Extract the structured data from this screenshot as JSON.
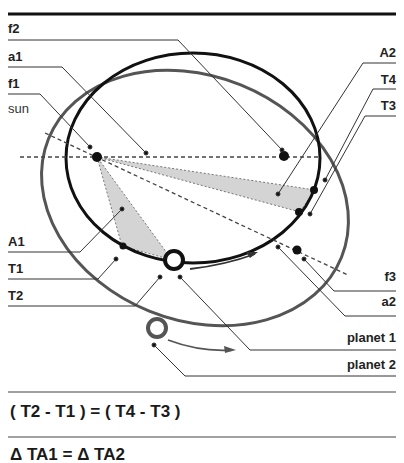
{
  "diagram": {
    "labels_left": {
      "f2": "f2",
      "a1": "a1",
      "f1": "f1",
      "sun": "sun",
      "A1": "A1",
      "T1": "T1",
      "T2": "T2"
    },
    "labels_right": {
      "A2": "A2",
      "T4": "T4",
      "T3": "T3",
      "f3": "f3",
      "a2": "a2",
      "planet1": "planet 1",
      "planet2": "planet 2"
    },
    "colors": {
      "orbit1": "#111111",
      "orbit2": "#555555",
      "sector_fill": "#d4d4d4",
      "leader": "#333333"
    }
  },
  "equations": {
    "eq1": "( T2 - T1 ) = ( T4 - T3 )",
    "eq2": "Δ TA1 = Δ TA2"
  }
}
